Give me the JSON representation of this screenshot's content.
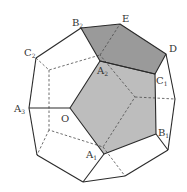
{
  "diagram": {
    "type": "polyhedron (truncated/dodecahedron-like solid) with shaded faces",
    "colors": {
      "edge": "#2a2a2a",
      "dashed_edge": "#4a4a4a",
      "shade_dark": "#9a9a9a",
      "shade_light": "#bdbdbd",
      "background": "#ffffff"
    },
    "labels": [
      {
        "id": "B2",
        "base": "B",
        "sub": "2",
        "x": 72,
        "y": 26
      },
      {
        "id": "E",
        "base": "E",
        "sub": "",
        "x": 122,
        "y": 22
      },
      {
        "id": "C2",
        "base": "C",
        "sub": "2",
        "x": 24,
        "y": 56
      },
      {
        "id": "D",
        "base": "D",
        "sub": "",
        "x": 169,
        "y": 52
      },
      {
        "id": "A2",
        "base": "A",
        "sub": "2",
        "x": 97,
        "y": 74
      },
      {
        "id": "C1",
        "base": "C",
        "sub": "1",
        "x": 156,
        "y": 84
      },
      {
        "id": "A3",
        "base": "A",
        "sub": "3",
        "x": 14,
        "y": 112
      },
      {
        "id": "O",
        "base": "O",
        "sub": "",
        "x": 61,
        "y": 122
      },
      {
        "id": "B1",
        "base": "B",
        "sub": "1",
        "x": 158,
        "y": 136
      },
      {
        "id": "A1",
        "base": "A",
        "sub": "1",
        "x": 86,
        "y": 158
      }
    ]
  }
}
